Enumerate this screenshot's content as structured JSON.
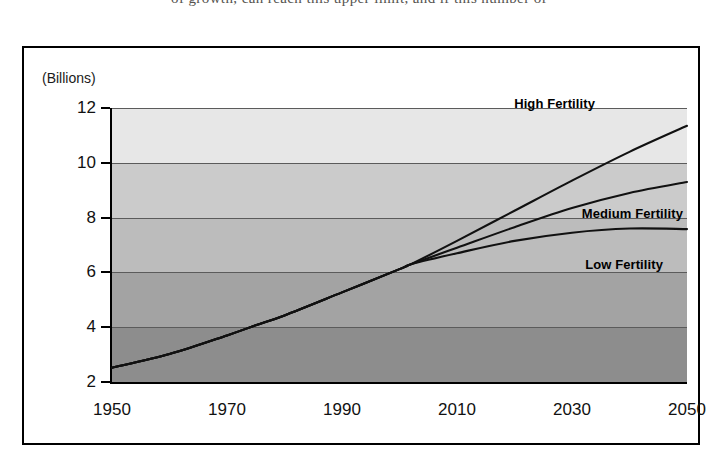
{
  "page": {
    "top_text": "of growth, can reach this upper limit, and if this number of"
  },
  "figure": {
    "unit_label": "(Billions)"
  },
  "chart_data": {
    "type": "line",
    "title": "",
    "xlabel": "",
    "ylabel": "(Billions)",
    "xlim": [
      1950,
      2050
    ],
    "ylim": [
      2,
      12
    ],
    "grid": true,
    "legend_position": "inline-right",
    "x_ticks": [
      "1950",
      "1970",
      "1990",
      "2010",
      "2030",
      "2050"
    ],
    "y_ticks": [
      "2",
      "4",
      "6",
      "8",
      "10",
      "12"
    ],
    "background_bands": [
      {
        "range": [
          10,
          12
        ],
        "color": "#e7e7e7"
      },
      {
        "range": [
          8,
          10
        ],
        "color": "#cbcbcb"
      },
      {
        "range": [
          6,
          8
        ],
        "color": "#bcbcbc"
      },
      {
        "range": [
          4,
          6
        ],
        "color": "#a3a3a3"
      },
      {
        "range": [
          2,
          4
        ],
        "color": "#8d8d8d"
      }
    ],
    "branch_point": {
      "x": 2002,
      "y": 6.3
    },
    "series": [
      {
        "name": "High Fertility",
        "label": "High Fertility",
        "x": [
          1950,
          1960,
          1970,
          1975,
          1980,
          1990,
          2000,
          2002,
          2010,
          2020,
          2030,
          2040,
          2050
        ],
        "values": [
          2.52,
          3.02,
          3.7,
          4.07,
          4.43,
          5.27,
          6.12,
          6.3,
          7.15,
          8.25,
          9.35,
          10.4,
          11.35
        ]
      },
      {
        "name": "Medium Fertility",
        "label": "Medium Fertility",
        "x": [
          1950,
          1960,
          1970,
          1975,
          1980,
          1990,
          2000,
          2002,
          2010,
          2020,
          2030,
          2040,
          2050
        ],
        "values": [
          2.52,
          3.02,
          3.7,
          4.07,
          4.43,
          5.27,
          6.12,
          6.3,
          6.9,
          7.65,
          8.35,
          8.9,
          9.3
        ]
      },
      {
        "name": "Low Fertility",
        "label": "Low Fertility",
        "x": [
          1950,
          1960,
          1970,
          1975,
          1980,
          1990,
          2000,
          2002,
          2010,
          2020,
          2030,
          2040,
          2050
        ],
        "values": [
          2.52,
          3.02,
          3.7,
          4.07,
          4.43,
          5.27,
          6.12,
          6.3,
          6.7,
          7.15,
          7.45,
          7.6,
          7.58
        ]
      }
    ]
  }
}
